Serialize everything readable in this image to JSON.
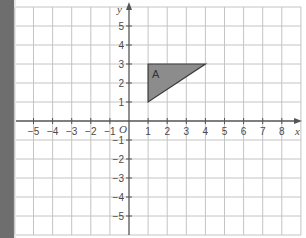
{
  "diagram": {
    "type": "coordinate-grid",
    "x_axis": {
      "label": "x",
      "ticks": [
        -5,
        -4,
        -3,
        -2,
        -1,
        1,
        2,
        3,
        4,
        5,
        6,
        7,
        8
      ],
      "tick_labels": [
        "−5",
        "−4",
        "−3",
        "−2",
        "−1",
        "1",
        "2",
        "3",
        "4",
        "5",
        "6",
        "7",
        "8"
      ]
    },
    "y_axis": {
      "label": "y",
      "ticks": [
        5,
        4,
        3,
        2,
        1,
        -1,
        -2,
        -3,
        -4,
        -5
      ],
      "tick_labels": [
        "5",
        "4",
        "3",
        "2",
        "1",
        "−1",
        "−2",
        "−3",
        "−4",
        "−5"
      ]
    },
    "origin_label": "O",
    "shapes": [
      {
        "name": "A",
        "type": "triangle",
        "vertices": [
          [
            1,
            1
          ],
          [
            1,
            3
          ],
          [
            4,
            3
          ]
        ],
        "fill": "#8c8c8c",
        "stroke": "#3a3a3a"
      }
    ],
    "colors": {
      "grid": "#c4c4c4",
      "axis": "#555555",
      "side_strip": "#6e6e6e"
    }
  }
}
